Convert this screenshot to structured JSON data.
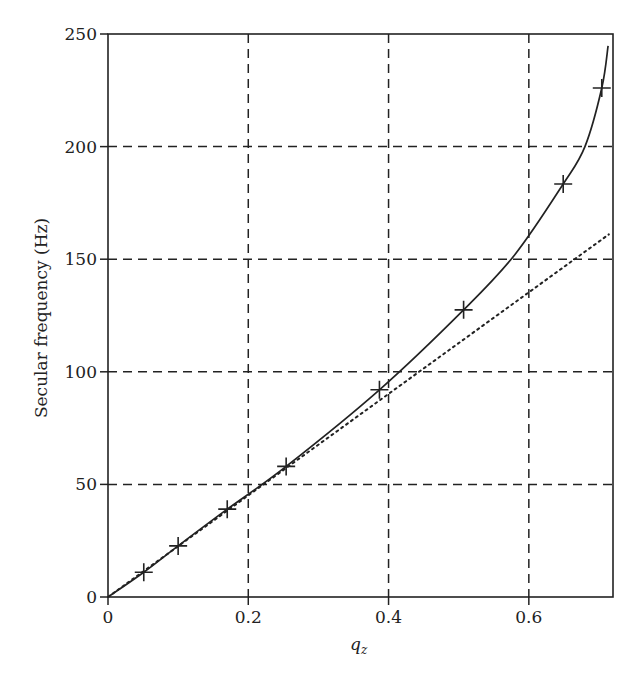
{
  "chart_data": {
    "type": "line",
    "title": "",
    "xlabel": "q_z",
    "xlabel_main": "q",
    "xlabel_sub": "z",
    "ylabel": "Secular frequency (Hz)",
    "xlim": [
      0,
      0.72
    ],
    "ylim": [
      0,
      250
    ],
    "grid": true,
    "grid_style": "dashed",
    "x_ticks": [
      0,
      0.2,
      0.4,
      0.6
    ],
    "x_tick_labels": [
      "0",
      "0.2",
      "0.4",
      "0.6"
    ],
    "y_ticks": [
      0,
      50,
      100,
      150,
      200,
      250
    ],
    "y_tick_labels": [
      "0",
      "50",
      "100",
      "150",
      "200",
      "250"
    ],
    "series": [
      {
        "name": "exact solution",
        "style": "solid",
        "x": [
          0,
          0.051,
          0.1,
          0.17,
          0.254,
          0.387,
          0.507,
          0.58,
          0.649,
          0.68,
          0.704,
          0.713
        ],
        "y": [
          0,
          11,
          22.7,
          39,
          58,
          92,
          127.5,
          152,
          183.4,
          200,
          226,
          244.7
        ]
      },
      {
        "name": "measured points",
        "style": "plus-markers",
        "x": [
          0.051,
          0.1,
          0.17,
          0.254,
          0.387,
          0.507,
          0.649,
          0.704
        ],
        "y": [
          11,
          22.7,
          39,
          58,
          92,
          127.5,
          183.4,
          226
        ]
      },
      {
        "name": "linear approximation",
        "style": "dotted",
        "x": [
          0,
          0.714
        ],
        "y": [
          0,
          161
        ]
      }
    ],
    "legend": null
  }
}
